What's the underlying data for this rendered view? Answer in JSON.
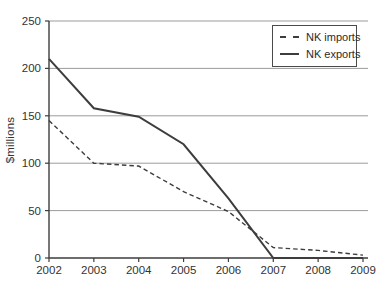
{
  "chart_data": {
    "type": "line",
    "title": "",
    "ylabel": "$millions",
    "xlabel": "",
    "ylim": [
      0,
      250
    ],
    "y_ticks": [
      0,
      50,
      100,
      150,
      200,
      250
    ],
    "x_ticks": [
      "2002",
      "2003",
      "2004",
      "2005",
      "2006",
      "2007",
      "2008",
      "2009"
    ],
    "grid": "horizontal",
    "legend_position": "top-right",
    "series": [
      {
        "name": "NK imports",
        "style": "dashed",
        "values": [
          145,
          100,
          97,
          70,
          49,
          11,
          8,
          3
        ]
      },
      {
        "name": "NK exports",
        "style": "solid",
        "values": [
          210,
          158,
          149,
          120,
          63,
          0,
          0,
          0
        ]
      }
    ],
    "colors": {
      "line": "#3d3d3d",
      "grid": "#9b9b9b",
      "axis": "#3d3d3d",
      "text": "#333333",
      "background": "#ffffff"
    }
  }
}
